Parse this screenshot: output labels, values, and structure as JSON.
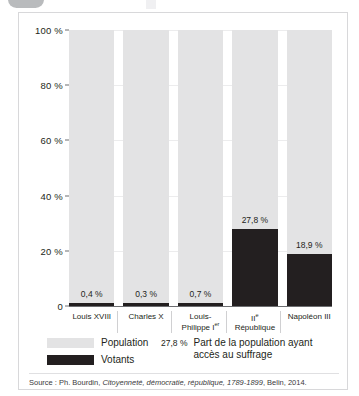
{
  "chart_data": {
    "type": "bar",
    "title": "",
    "subtitle": "",
    "xlabel": "",
    "ylabel": "",
    "ylim": [
      0,
      100
    ],
    "grid": true,
    "legend_position": "bottom-left",
    "categories": [
      "Louis XVIII",
      "Charles X",
      "Louis-Philippe Ier",
      "IIe République",
      "Napoléon III"
    ],
    "category_lines": [
      [
        "Louis XVIII"
      ],
      [
        "Charles X"
      ],
      [
        "Louis-",
        "Philippe I",
        "er"
      ],
      [
        "II",
        "e",
        " République"
      ],
      [
        "Napoléon III"
      ]
    ],
    "series": [
      {
        "name": "Population",
        "values": [
          100,
          100,
          100,
          100,
          100
        ],
        "color": "#e3e3e4"
      },
      {
        "name": "Votants",
        "values": [
          0.4,
          0.3,
          0.7,
          27.8,
          18.9
        ],
        "color": "#231f20"
      }
    ],
    "value_labels": [
      "0,4 %",
      "0,3 %",
      "0,7 %",
      "27,8 %",
      "18,9 %"
    ],
    "y_ticks": [
      {
        "value": 100,
        "label": "100 %"
      },
      {
        "value": 80,
        "label": "80 %"
      },
      {
        "value": 60,
        "label": "60 %"
      },
      {
        "value": 40,
        "label": "40 %"
      },
      {
        "value": 20,
        "label": "20 %"
      },
      {
        "value": 0,
        "label": "0"
      }
    ]
  },
  "legend": {
    "population_label": "Population",
    "votants_label": "Votants",
    "note_value": "27,8 %",
    "note_text": "Part de la population ayant accès au suffrage"
  },
  "source": {
    "prefix": "Source : Ph. Bourdin, ",
    "title_italic": "Citoyenneté, démocratie, république, 1789-1899",
    "suffix": ", Belin, 2014."
  }
}
